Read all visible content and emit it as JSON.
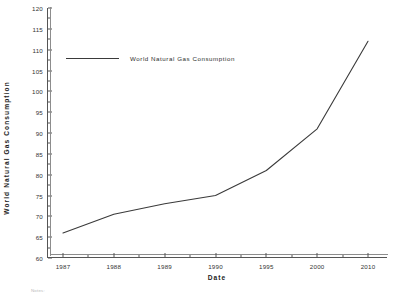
{
  "chart_data": {
    "type": "line",
    "title": "",
    "xlabel": "Date",
    "ylabel": "World  Natural  Gas  Consumption",
    "categories": [
      "1987",
      "1988",
      "1989",
      "1990",
      "1995",
      "2000",
      "2010"
    ],
    "series": [
      {
        "name": "World Natural Gas Consumption",
        "values": [
          66,
          70.5,
          73,
          75,
          81,
          91,
          112
        ]
      }
    ],
    "ylim": [
      60,
      120
    ],
    "ytick_labels": [
      "60",
      "65",
      "70",
      "75",
      "80",
      "85",
      "90",
      "95",
      "100",
      "105",
      "110",
      "115",
      "120"
    ],
    "ytick_values": [
      60,
      65,
      70,
      75,
      80,
      85,
      90,
      95,
      100,
      105,
      110,
      115,
      120
    ],
    "y_minor_per_interval": 1,
    "x_minor_per_interval": 1,
    "grid": false,
    "legend": {
      "position": "inside-top-left",
      "entries": [
        "World Natural Gas Consumption"
      ]
    },
    "line_color": "#3a3a3a",
    "axis_color": "#555555"
  },
  "footer": {
    "notes_label": "Notes:"
  }
}
